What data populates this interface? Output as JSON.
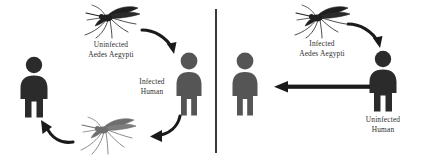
{
  "diagram": {
    "colors": {
      "figure_dark": "#2b2b2b",
      "figure_mid": "#555555",
      "mosquito_dark": "#1f1f1f",
      "mosquito_light": "#6e6e6e",
      "arrow": "#1a1a1a",
      "divider": "#3a3a3a",
      "text": "#2e2e2e",
      "background": "#ffffff"
    },
    "left_panel": {
      "name": "human-to-mosquito-cycle",
      "mosquito_top": {
        "icon": "mosquito-icon",
        "caption_line1": "Uninfected",
        "caption_line2": "Aedes Aegypti"
      },
      "mosquito_bottom": {
        "icon": "mosquito-icon",
        "caption_line1": "",
        "caption_line2": ""
      },
      "human_right": {
        "icon": "person-icon",
        "caption_line1": "Infected",
        "caption_line2": "Human"
      },
      "human_left": {
        "icon": "person-icon",
        "caption_line1": "",
        "caption_line2": ""
      },
      "arrows": [
        {
          "name": "arrow-mosquito-to-infected-human",
          "direction": "curve-down-right"
        },
        {
          "name": "arrow-infected-human-to-mosquito",
          "direction": "curve-left"
        },
        {
          "name": "arrow-mosquito-to-left-human",
          "direction": "curve-up-left"
        }
      ]
    },
    "right_panel": {
      "name": "mosquito-to-human-transmission",
      "mosquito": {
        "icon": "mosquito-icon",
        "caption_line1": "Infected",
        "caption_line2": "Aedes Aegypti"
      },
      "human_right": {
        "icon": "person-icon",
        "caption_line1": "Uninfected",
        "caption_line2": "Human"
      },
      "human_left": {
        "icon": "person-icon",
        "caption_line1": "",
        "caption_line2": ""
      },
      "arrows": [
        {
          "name": "arrow-mosquito-to-uninfected-human",
          "direction": "curve-down-right"
        },
        {
          "name": "arrow-transmission-leftward",
          "direction": "straight-left"
        }
      ]
    }
  }
}
